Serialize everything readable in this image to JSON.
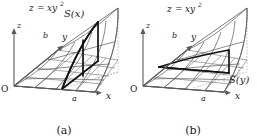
{
  "figure": {
    "background_color": "#ffffff",
    "ink_color": "#1a1a1a",
    "mesh_color": "#6e6e6e",
    "highlight_color": "#111111",
    "dashed_color": "#9a9a9a",
    "panels": [
      {
        "id": "a",
        "caption": "(a)",
        "surface_label": "z = xy²",
        "surface_label_parts": {
          "lhs": "z",
          "eq": "=",
          "base": "xy",
          "exp": "2"
        },
        "cross_section_label": "S(x)",
        "axis_z": "z",
        "axis_y": "y",
        "axis_x": "x",
        "origin": "O",
        "tick_x": "a",
        "tick_y": "b",
        "slice_direction": "y-direction slice at fixed x"
      },
      {
        "id": "b",
        "caption": "(b)",
        "surface_label": "z = xy²",
        "surface_label_parts": {
          "lhs": "z",
          "eq": "=",
          "base": "xy",
          "exp": "2"
        },
        "cross_section_label": "S(y)",
        "axis_z": "z",
        "axis_y": "y",
        "axis_x": "x",
        "origin": "O",
        "tick_x": "a",
        "tick_y": "b",
        "slice_direction": "x-direction slice at fixed y"
      }
    ]
  }
}
